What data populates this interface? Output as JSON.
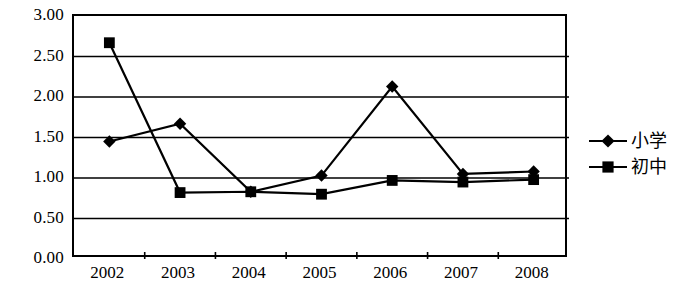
{
  "chart_data": {
    "type": "line",
    "title": "",
    "subtitle": "",
    "xlabel": "",
    "ylabel": "",
    "categories": [
      "2002",
      "2003",
      "2004",
      "2005",
      "2006",
      "2007",
      "2008"
    ],
    "ylim": [
      0,
      3
    ],
    "ytick_labels": [
      "0.00",
      "0.50",
      "1.00",
      "1.50",
      "2.00",
      "2.50",
      "3.00"
    ],
    "ytick_values": [
      0,
      0.5,
      1,
      1.5,
      2,
      2.5,
      3
    ],
    "grid": true,
    "grid_axis": "y",
    "legend_position": "right",
    "series": [
      {
        "name": "小学",
        "marker": "diamond",
        "color": "#000000",
        "values": [
          1.45,
          1.67,
          0.83,
          1.03,
          2.13,
          1.05,
          1.08
        ]
      },
      {
        "name": "初中",
        "marker": "square",
        "color": "#000000",
        "values": [
          2.67,
          0.82,
          0.83,
          0.8,
          0.97,
          0.95,
          0.98
        ]
      }
    ]
  },
  "legend": {
    "items": [
      {
        "label": "小学",
        "marker": "diamond-marker-icon"
      },
      {
        "label": "初中",
        "marker": "square-marker-icon"
      }
    ]
  }
}
